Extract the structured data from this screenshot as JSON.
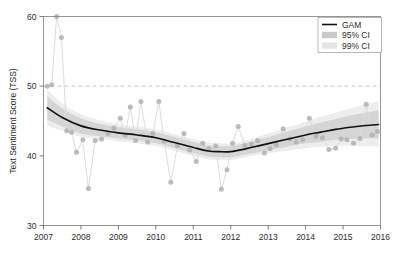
{
  "chart_data": {
    "type": "scatter",
    "title": "",
    "xlabel": "",
    "ylabel": "Text Sentiment Score (TSS)",
    "xlim": [
      2007.0,
      2016.0
    ],
    "ylim": [
      30,
      60
    ],
    "xticks": [
      "2007",
      "2008",
      "2009",
      "2010",
      "2011",
      "2012",
      "2013",
      "2014",
      "2015",
      "2016"
    ],
    "yticks": [
      "30",
      "40",
      "50",
      "60"
    ],
    "grid": false,
    "legend_position": "top-right",
    "reference_line": {
      "y": 50,
      "style": "dashed",
      "color": "#b9b9b9"
    },
    "legend": [
      {
        "label": "GAM",
        "marker": "line",
        "color": "#111111"
      },
      {
        "label": "95% CI",
        "marker": "band",
        "color": "#c9c9c9"
      },
      {
        "label": "99% CI",
        "marker": "band",
        "color": "#e4e4e4"
      }
    ],
    "series": [
      {
        "name": "Observed TSS",
        "marker": "circle",
        "color": "#b0b0b0",
        "line_color": "#dcdcdc",
        "x": [
          2007.1,
          2007.22,
          2007.35,
          2007.48,
          2007.62,
          2007.75,
          2007.88,
          2008.05,
          2008.2,
          2008.38,
          2008.55,
          2008.72,
          2008.88,
          2009.05,
          2009.18,
          2009.32,
          2009.46,
          2009.6,
          2009.78,
          2009.92,
          2010.08,
          2010.22,
          2010.4,
          2010.58,
          2010.75,
          2010.9,
          2011.08,
          2011.25,
          2011.42,
          2011.6,
          2011.75,
          2011.9,
          2012.05,
          2012.2,
          2012.38,
          2012.55,
          2012.72,
          2012.9,
          2013.05,
          2013.22,
          2013.4,
          2013.58,
          2013.75,
          2013.92,
          2014.1,
          2014.28,
          2014.45,
          2014.62,
          2014.8,
          2014.95,
          2015.1,
          2015.28,
          2015.45,
          2015.62,
          2015.78,
          2015.92
        ],
        "y": [
          50.0,
          50.2,
          60.0,
          57.0,
          43.6,
          43.4,
          40.5,
          42.3,
          35.3,
          42.2,
          42.4,
          43.2,
          44.0,
          45.4,
          43.0,
          47.0,
          42.2,
          47.8,
          42.0,
          43.2,
          47.8,
          42.1,
          36.2,
          41.5,
          43.2,
          40.8,
          39.2,
          41.8,
          41.0,
          41.4,
          35.2,
          38.0,
          41.8,
          44.2,
          41.5,
          41.7,
          42.2,
          40.4,
          41.0,
          41.6,
          43.9,
          42.4,
          42.0,
          42.3,
          45.4,
          42.8,
          42.6,
          40.9,
          41.1,
          42.4,
          42.3,
          41.8,
          42.5,
          47.4,
          43.0,
          43.5
        ]
      }
    ],
    "gam_fit": {
      "name": "GAM",
      "color": "#111111",
      "x": [
        2007.1,
        2007.5,
        2008.0,
        2008.5,
        2009.0,
        2009.5,
        2010.0,
        2010.5,
        2011.0,
        2011.4,
        2011.7,
        2012.0,
        2012.4,
        2012.8,
        2013.2,
        2013.6,
        2014.0,
        2014.4,
        2014.8,
        2015.2,
        2015.6,
        2015.95
      ],
      "y": [
        46.9,
        45.5,
        44.3,
        43.7,
        43.3,
        43.0,
        42.6,
        41.9,
        41.2,
        40.7,
        40.6,
        40.6,
        41.0,
        41.5,
        42.0,
        42.5,
        43.0,
        43.4,
        43.8,
        44.1,
        44.35,
        44.5
      ]
    },
    "ci95": {
      "upper": [
        48.6,
        46.8,
        45.4,
        44.6,
        44.1,
        43.8,
        43.4,
        42.7,
        42.0,
        41.5,
        41.4,
        41.4,
        41.8,
        42.4,
        43.0,
        43.6,
        44.2,
        44.8,
        45.3,
        45.8,
        46.2,
        46.5
      ],
      "lower": [
        45.2,
        44.2,
        43.2,
        42.8,
        42.5,
        42.2,
        41.8,
        41.1,
        40.4,
        39.9,
        39.8,
        39.8,
        40.2,
        40.6,
        41.0,
        41.4,
        41.8,
        42.0,
        42.3,
        42.4,
        42.5,
        42.5
      ]
    },
    "ci99": {
      "upper": [
        49.6,
        47.5,
        46.0,
        45.1,
        44.5,
        44.2,
        43.8,
        43.1,
        42.4,
        41.9,
        41.8,
        41.8,
        42.2,
        42.9,
        43.5,
        44.2,
        44.9,
        45.6,
        46.2,
        46.8,
        47.4,
        47.8
      ],
      "lower": [
        44.3,
        43.6,
        42.7,
        42.4,
        42.1,
        41.8,
        41.4,
        40.7,
        40.0,
        39.5,
        39.4,
        39.4,
        39.8,
        40.2,
        40.5,
        40.8,
        41.1,
        41.3,
        41.4,
        41.5,
        41.4,
        41.3
      ]
    }
  }
}
